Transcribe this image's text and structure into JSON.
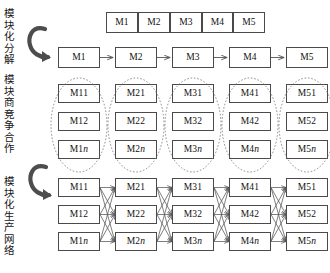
{
  "diagram": {
    "title": "",
    "stage_labels": [
      {
        "id": "stage-1",
        "text": "模块化分解"
      },
      {
        "id": "stage-2",
        "text": "模块商竞争合作"
      },
      {
        "id": "stage-3",
        "text": "模块化生产网络"
      }
    ],
    "arrows": [
      {
        "id": "curved-arrow-1",
        "name": "curved-arrow-decomposition"
      },
      {
        "id": "curved-arrow-2",
        "name": "curved-arrow-network"
      }
    ],
    "top_bar": {
      "name": "product-architecture-bar",
      "cells": [
        "M1",
        "M2",
        "M3",
        "M4",
        "M5"
      ]
    },
    "module_chain": {
      "name": "module-chain-row",
      "nodes": [
        "M1",
        "M2",
        "M3",
        "M4",
        "M5"
      ],
      "connector": "arrow-right"
    },
    "supplier_groups": [
      {
        "group": "M1",
        "ellipse": "dashed",
        "members": [
          "M11",
          "M12",
          "M1n"
        ]
      },
      {
        "group": "M2",
        "ellipse": "dashed",
        "members": [
          "M21",
          "M22",
          "M2n"
        ]
      },
      {
        "group": "M3",
        "ellipse": "dashed",
        "members": [
          "M31",
          "M32",
          "M3n"
        ]
      },
      {
        "group": "M4",
        "ellipse": "dashed",
        "members": [
          "M41",
          "M42",
          "M4n"
        ]
      },
      {
        "group": "M5",
        "ellipse": "dashed",
        "members": [
          "M51",
          "M52",
          "M5n"
        ]
      }
    ],
    "network_columns": [
      {
        "group": "M1",
        "members": [
          "M11",
          "M12",
          "M1n"
        ]
      },
      {
        "group": "M2",
        "members": [
          "M21",
          "M22",
          "M2n"
        ]
      },
      {
        "group": "M3",
        "members": [
          "M31",
          "M32",
          "M3n"
        ]
      },
      {
        "group": "M4",
        "members": [
          "M41",
          "M42",
          "M4n"
        ]
      },
      {
        "group": "M5",
        "members": [
          "M51",
          "M52",
          "M5n"
        ]
      }
    ],
    "colors": {
      "box_border": "#4a4a4a",
      "line": "#555555",
      "arrow_glyph": "#4d4d4d",
      "text": "#111111",
      "background": "#ffffff"
    }
  }
}
